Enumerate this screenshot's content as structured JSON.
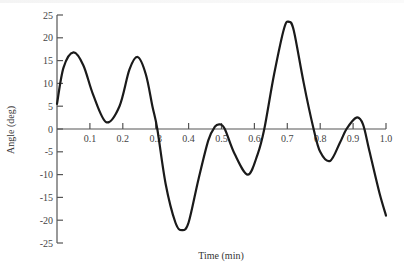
{
  "chart_data": {
    "type": "line",
    "title": "",
    "xlabel": "Time (min)",
    "ylabel": "Angle (deg)",
    "xlim": [
      0,
      1.0
    ],
    "ylim": [
      -25,
      25
    ],
    "grid": false,
    "legend": null,
    "x_ticks": [
      0.1,
      0.2,
      0.3,
      0.4,
      0.5,
      0.6,
      0.7,
      0.8,
      0.9,
      1.0
    ],
    "x_tick_labels": [
      "0.1",
      "0.2",
      "0.3",
      "0.4",
      "0.5",
      "0.6",
      "0.7",
      "0.8",
      "0.9",
      "1.0"
    ],
    "y_ticks": [
      25,
      20,
      15,
      10,
      5,
      0,
      -5,
      -10,
      -15,
      -20,
      -25
    ],
    "y_tick_labels": [
      "25",
      "20",
      "15",
      "10",
      "5",
      "0",
      "-5",
      "-10",
      "-15",
      "-20",
      "-25"
    ],
    "series": [
      {
        "name": "Angle",
        "x": [
          0.0,
          0.02,
          0.05,
          0.08,
          0.11,
          0.15,
          0.19,
          0.22,
          0.245,
          0.27,
          0.29,
          0.305,
          0.33,
          0.36,
          0.38,
          0.4,
          0.43,
          0.46,
          0.48,
          0.495,
          0.51,
          0.54,
          0.58,
          0.61,
          0.63,
          0.66,
          0.69,
          0.705,
          0.72,
          0.75,
          0.78,
          0.8,
          0.83,
          0.86,
          0.88,
          0.91,
          0.93,
          0.95,
          0.98,
          1.0
        ],
        "y": [
          5.5,
          13.5,
          16.8,
          14.0,
          7.5,
          1.5,
          5.0,
          13.0,
          15.8,
          12.0,
          5.0,
          0.0,
          -12.0,
          -20.5,
          -22.2,
          -20.5,
          -11.0,
          -2.5,
          0.5,
          1.0,
          0.0,
          -5.5,
          -10.0,
          -5.5,
          0.0,
          12.0,
          22.0,
          23.5,
          21.5,
          10.0,
          0.0,
          -5.0,
          -7.0,
          -3.0,
          0.0,
          2.5,
          1.0,
          -5.0,
          -14.0,
          -19.0
        ]
      }
    ]
  }
}
